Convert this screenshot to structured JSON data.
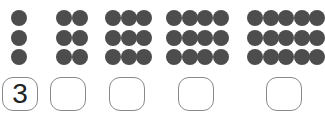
{
  "exercise": {
    "groups": [
      {
        "columns": 1,
        "rows": 3,
        "answer": "3"
      },
      {
        "columns": 2,
        "rows": 3,
        "answer": ""
      },
      {
        "columns": 3,
        "rows": 3,
        "answer": ""
      },
      {
        "columns": 4,
        "rows": 3,
        "answer": ""
      },
      {
        "columns": 5,
        "rows": 3,
        "answer": ""
      }
    ],
    "colors": {
      "dot": "#4d4d4d",
      "box_border": "#8a8a8a"
    }
  }
}
